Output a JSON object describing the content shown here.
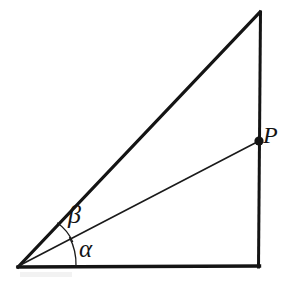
{
  "figure": {
    "background_color": "#ffffff",
    "stroke_color": "#141414",
    "width": 285,
    "height": 282,
    "labels": {
      "alpha": "α",
      "beta": "β",
      "point_p": "P"
    },
    "vertices": {
      "origin": {
        "name": "origin-vertex",
        "x": 18,
        "y": 267
      },
      "apex": {
        "name": "apex-vertex",
        "x": 260,
        "y": 12
      },
      "bottom_right": {
        "name": "bottom-right-vertex",
        "x": 259,
        "y": 267
      }
    },
    "point_p": {
      "name": "point-p",
      "x": 259,
      "y": 141,
      "dot_radius": 4.6
    },
    "edges": [
      {
        "name": "base-edge",
        "from": "origin",
        "to": "bottom_right",
        "stroke_width": 3.4
      },
      {
        "name": "vertical-edge",
        "from": "apex",
        "to": "bottom_right",
        "stroke_width": 3.0
      },
      {
        "name": "hypotenuse-edge",
        "from": "origin",
        "to": "apex",
        "stroke_width": 3.2
      }
    ],
    "rays": [
      {
        "name": "ray-to-point-p",
        "from": "origin",
        "to": "point_p",
        "stroke_width": 1.6
      }
    ],
    "angles": [
      {
        "name": "angle-alpha",
        "label": "α",
        "between": [
          "base-edge",
          "ray-to-point-p"
        ],
        "degrees": 27.6,
        "arc_radius": 58
      },
      {
        "name": "angle-beta",
        "label": "β",
        "between": [
          "ray-to-point-p",
          "hypotenuse-edge"
        ],
        "degrees": 18.9,
        "arc_radius": 46
      }
    ]
  }
}
